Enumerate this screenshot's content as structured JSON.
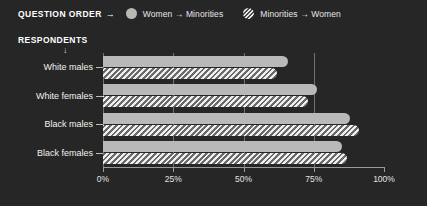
{
  "legend": {
    "title": "QUESTION ORDER",
    "arrow_icon": "arrow-right",
    "items": [
      {
        "label": "Women → Minorities",
        "marker": "solid-circle",
        "color": "#b9b9b9"
      },
      {
        "label": "Minorities → Women",
        "marker": "hatched-circle",
        "color": "#efefef"
      }
    ]
  },
  "respondents_caption": {
    "label": "RESPONDENTS",
    "arrow_icon": "arrow-down"
  },
  "chart_data": {
    "type": "bar",
    "orientation": "horizontal",
    "title": "",
    "xlabel": "",
    "ylabel": "RESPONDENTS",
    "xlim": [
      0,
      100
    ],
    "grid": true,
    "legend_position": "top",
    "categories": [
      "White males",
      "White females",
      "Black males",
      "Black females"
    ],
    "xticks": [
      0,
      25,
      50,
      75,
      100
    ],
    "xticklabels": [
      "0%",
      "25%",
      "50%",
      "75%",
      "100%"
    ],
    "series": [
      {
        "name": "Women → Minorities",
        "style": "solid",
        "values": [
          66,
          76,
          88,
          85
        ]
      },
      {
        "name": "Minorities → Women",
        "style": "hatched",
        "values": [
          62,
          73,
          91,
          87
        ]
      }
    ]
  },
  "colors": {
    "background": "#262626",
    "solid_bar": "#b9b9b9",
    "hatch_light": "#efefef",
    "hatch_dark": "#6a6a6a",
    "grid": "#8c8c8c",
    "axis": "#9a9a9a",
    "text": "#f2f2f2"
  }
}
